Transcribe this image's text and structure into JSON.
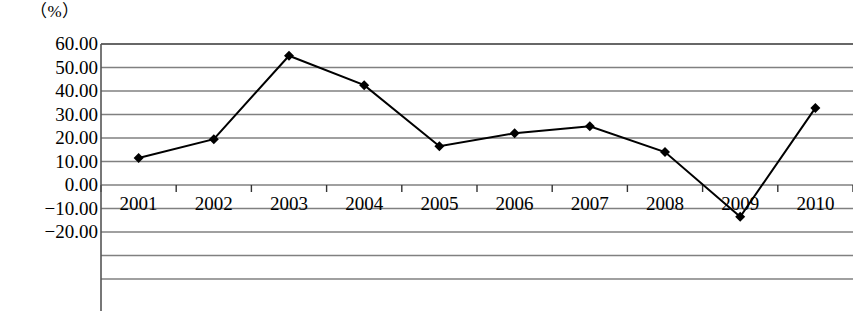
{
  "chart_data": {
    "type": "line",
    "title": "（%）",
    "xlabel": "",
    "ylabel": "",
    "unit_label": "（%）",
    "categories": [
      "2001",
      "2002",
      "2003",
      "2004",
      "2005",
      "2006",
      "2007",
      "2008",
      "2009",
      "2010"
    ],
    "values": [
      11.5,
      19.5,
      55.0,
      42.5,
      16.5,
      22.0,
      25.0,
      14.0,
      -13.5,
      32.8
    ],
    "series": [
      {
        "name": "",
        "values": [
          11.5,
          19.5,
          55.0,
          42.5,
          16.5,
          22.0,
          25.0,
          14.0,
          -13.5,
          32.8
        ]
      }
    ],
    "ylim": [
      -20.0,
      60.0
    ],
    "y_ticks": [
      60.0,
      50.0,
      40.0,
      30.0,
      20.0,
      10.0,
      0.0,
      -10.0,
      -20.0
    ],
    "y_tick_labels": [
      "60.00",
      "50.00",
      "40.00",
      "30.00",
      "20.00",
      "10.00",
      "0.00",
      "-10.00",
      "-20.00"
    ],
    "grid": true,
    "legend": "none",
    "marker": "diamond",
    "line_color": "#000000",
    "marker_color": "#000000",
    "grid_color": "#808080",
    "axis_color": "#555555",
    "background_color": "#ffffff"
  }
}
